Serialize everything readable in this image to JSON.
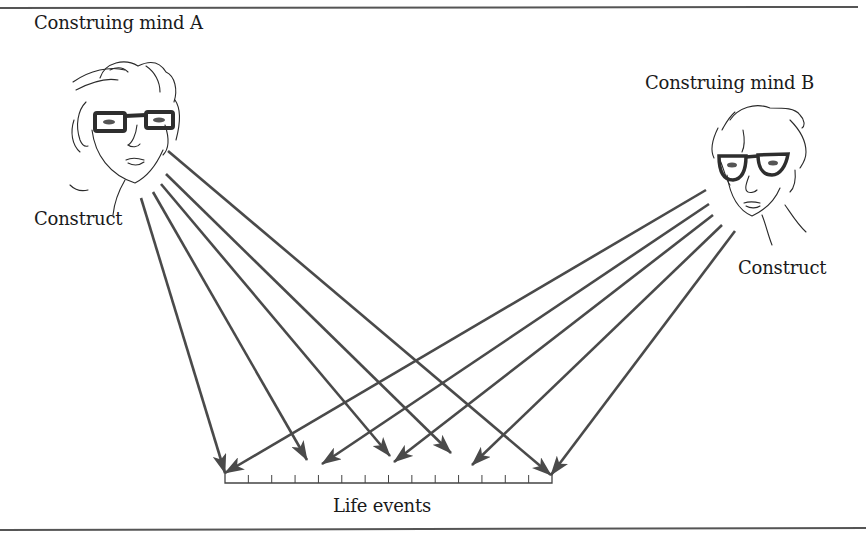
{
  "figure": {
    "mind_a": {
      "title": "Construing mind A",
      "construct_label": "Construct"
    },
    "mind_b": {
      "title": "Construing mind B",
      "construct_label": "Construct"
    },
    "axis_label": "Life events",
    "colors": {
      "ink": "#1a1a1a",
      "arrow": "#4a4a4a",
      "rule": "#555555",
      "sketch": "#2a2a2a"
    }
  },
  "arrows": {
    "from_a": [
      {
        "x1": 141,
        "y1": 198,
        "x2": 225,
        "y2": 473
      },
      {
        "x1": 153,
        "y1": 192,
        "x2": 307,
        "y2": 460
      },
      {
        "x1": 161,
        "y1": 184,
        "x2": 390,
        "y2": 456
      },
      {
        "x1": 166,
        "y1": 174,
        "x2": 451,
        "y2": 453
      },
      {
        "x1": 168,
        "y1": 151,
        "x2": 551,
        "y2": 475
      }
    ],
    "from_b": [
      {
        "x1": 706,
        "y1": 190,
        "x2": 225,
        "y2": 473
      },
      {
        "x1": 709,
        "y1": 204,
        "x2": 322,
        "y2": 464
      },
      {
        "x1": 713,
        "y1": 215,
        "x2": 394,
        "y2": 462
      },
      {
        "x1": 722,
        "y1": 225,
        "x2": 472,
        "y2": 465
      },
      {
        "x1": 735,
        "y1": 231,
        "x2": 551,
        "y2": 475
      }
    ]
  },
  "axis": {
    "x_start": 225,
    "x_end": 552,
    "y": 483,
    "ticks": 14
  }
}
